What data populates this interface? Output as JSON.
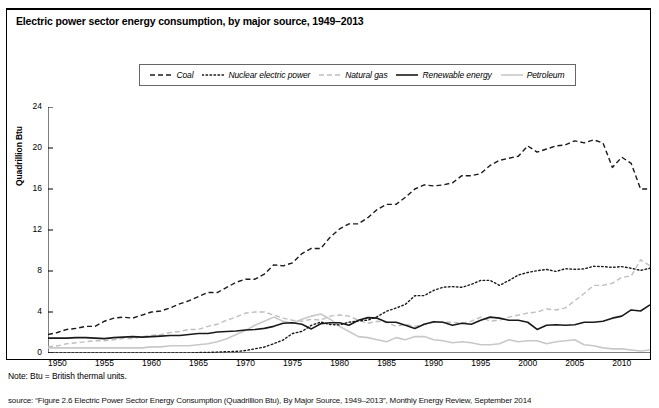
{
  "figure": {
    "title": "Electric power sector energy consumption, by major source, 1949–2013",
    "note": "Note: Btu = British thermal units.",
    "source": "source: “Figure 2.6  Electric Power Sector Energy Consumption (Quadrillion Btu), By Major Source, 1949–2013”, Monthly Energy Review, September 2014"
  },
  "chart_data": {
    "type": "line",
    "title": "Electric power sector energy consumption, by major source, 1949–2013",
    "xlabel": "",
    "ylabel": "Quadrillion Btu",
    "xlim": [
      1949,
      2013
    ],
    "ylim": [
      0,
      24
    ],
    "yticks": [
      0,
      4,
      8,
      12,
      16,
      20,
      24
    ],
    "xticks": [
      1950,
      1955,
      1960,
      1965,
      1970,
      1975,
      1980,
      1985,
      1990,
      1995,
      2000,
      2005,
      2010
    ],
    "grid": false,
    "legend_position": "top-center",
    "x": [
      1949,
      1950,
      1951,
      1952,
      1953,
      1954,
      1955,
      1956,
      1957,
      1958,
      1959,
      1960,
      1961,
      1962,
      1963,
      1964,
      1965,
      1966,
      1967,
      1968,
      1969,
      1970,
      1971,
      1972,
      1973,
      1974,
      1975,
      1976,
      1977,
      1978,
      1979,
      1980,
      1981,
      1982,
      1983,
      1984,
      1985,
      1986,
      1987,
      1988,
      1989,
      1990,
      1991,
      1992,
      1993,
      1994,
      1995,
      1996,
      1997,
      1998,
      1999,
      2000,
      2001,
      2002,
      2003,
      2004,
      2005,
      2006,
      2007,
      2008,
      2009,
      2010,
      2011,
      2012,
      2013
    ],
    "series": [
      {
        "name": "Coal",
        "style": "dashed",
        "color": "#1a1a1a",
        "values": [
          1.8,
          2.0,
          2.3,
          2.4,
          2.6,
          2.6,
          3.1,
          3.4,
          3.5,
          3.4,
          3.7,
          4.0,
          4.1,
          4.4,
          4.8,
          5.1,
          5.5,
          5.9,
          5.9,
          6.4,
          6.9,
          7.2,
          7.2,
          7.7,
          8.6,
          8.5,
          8.8,
          9.7,
          10.2,
          10.2,
          11.3,
          12.1,
          12.6,
          12.6,
          13.2,
          14.0,
          14.5,
          14.5,
          15.2,
          16.0,
          16.4,
          16.3,
          16.4,
          16.6,
          17.3,
          17.3,
          17.5,
          18.3,
          18.8,
          19.0,
          19.2,
          20.2,
          19.6,
          19.9,
          20.2,
          20.3,
          20.7,
          20.5,
          20.8,
          20.5,
          18.1,
          19.1,
          18.5,
          16.0,
          16.0
        ]
      },
      {
        "name": "Nuclear electric power",
        "style": "dotted",
        "color": "#1a1a1a",
        "values": [
          0.0,
          0.0,
          0.0,
          0.0,
          0.0,
          0.0,
          0.0,
          0.0,
          0.0,
          0.0,
          0.0,
          0.0,
          0.0,
          0.0,
          0.0,
          0.0,
          0.04,
          0.06,
          0.09,
          0.13,
          0.15,
          0.24,
          0.41,
          0.58,
          0.91,
          1.27,
          1.9,
          2.11,
          2.7,
          3.02,
          2.78,
          2.74,
          3.01,
          3.13,
          3.2,
          3.55,
          4.08,
          4.38,
          4.75,
          5.59,
          5.6,
          6.1,
          6.42,
          6.48,
          6.41,
          6.69,
          7.08,
          7.09,
          6.6,
          7.07,
          7.61,
          7.86,
          8.03,
          8.15,
          7.96,
          8.22,
          8.16,
          8.21,
          8.46,
          8.43,
          8.35,
          8.43,
          8.27,
          8.06,
          8.27
        ]
      },
      {
        "name": "Natural gas",
        "style": "dashed",
        "color": "#bfbfbf",
        "values": [
          0.6,
          0.7,
          0.9,
          1.0,
          1.1,
          1.2,
          1.2,
          1.3,
          1.4,
          1.4,
          1.6,
          1.7,
          1.8,
          2.0,
          2.1,
          2.3,
          2.3,
          2.6,
          2.8,
          3.2,
          3.5,
          3.9,
          4.0,
          4.0,
          3.7,
          3.4,
          3.2,
          3.1,
          3.3,
          3.2,
          3.6,
          3.7,
          3.6,
          3.2,
          2.9,
          3.1,
          3.0,
          2.6,
          2.8,
          2.6,
          2.8,
          3.0,
          3.0,
          3.0,
          2.9,
          3.1,
          3.5,
          3.1,
          3.2,
          3.5,
          3.7,
          3.9,
          4.0,
          4.3,
          4.2,
          4.4,
          5.1,
          5.8,
          6.6,
          6.6,
          6.8,
          7.4,
          7.5,
          9.1,
          8.5
        ]
      },
      {
        "name": "Renewable energy",
        "style": "solid",
        "color": "#1a1a1a",
        "values": [
          1.45,
          1.45,
          1.45,
          1.5,
          1.5,
          1.45,
          1.4,
          1.5,
          1.55,
          1.6,
          1.55,
          1.6,
          1.65,
          1.7,
          1.7,
          1.8,
          1.9,
          1.9,
          2.05,
          2.1,
          2.15,
          2.25,
          2.3,
          2.4,
          2.6,
          2.9,
          2.95,
          2.8,
          2.35,
          2.85,
          2.95,
          2.95,
          2.7,
          3.2,
          3.45,
          3.4,
          3.0,
          3.0,
          2.7,
          2.4,
          2.8,
          3.05,
          3.0,
          2.7,
          2.9,
          2.8,
          3.2,
          3.5,
          3.4,
          3.2,
          3.2,
          3.0,
          2.3,
          2.7,
          2.75,
          2.7,
          2.75,
          3.0,
          3.0,
          3.1,
          3.4,
          3.6,
          4.2,
          4.1,
          4.7
        ]
      },
      {
        "name": "Petroleum",
        "style": "solid",
        "color": "#c8c8c8",
        "values": [
          0.5,
          0.5,
          0.5,
          0.5,
          0.5,
          0.5,
          0.5,
          0.5,
          0.5,
          0.5,
          0.5,
          0.6,
          0.6,
          0.7,
          0.7,
          0.7,
          0.8,
          0.9,
          1.1,
          1.4,
          1.8,
          2.2,
          2.7,
          3.1,
          3.5,
          3.1,
          2.9,
          3.3,
          3.6,
          3.8,
          3.3,
          2.6,
          2.1,
          1.6,
          1.5,
          1.3,
          1.1,
          1.5,
          1.3,
          1.6,
          1.6,
          1.3,
          1.2,
          1.0,
          1.1,
          1.0,
          0.8,
          0.8,
          0.9,
          1.3,
          1.1,
          1.2,
          1.2,
          0.9,
          1.1,
          1.2,
          1.3,
          0.8,
          0.7,
          0.5,
          0.4,
          0.4,
          0.3,
          0.2,
          0.3
        ]
      }
    ]
  },
  "legend": {
    "items": [
      {
        "label": "Coal",
        "style": "dashed",
        "color": "#1a1a1a"
      },
      {
        "label": "Nuclear electric power",
        "style": "dotted",
        "color": "#1a1a1a"
      },
      {
        "label": "Natural gas",
        "style": "dashed",
        "color": "#bfbfbf"
      },
      {
        "label": "Renewable energy",
        "style": "solid",
        "color": "#1a1a1a"
      },
      {
        "label": "Petroleum",
        "style": "solid",
        "color": "#c8c8c8"
      }
    ]
  },
  "axes": {
    "y": {
      "label": "Quadrillion Btu",
      "ticks": [
        "0",
        "4",
        "8",
        "12",
        "16",
        "20",
        "24"
      ]
    },
    "x": {
      "ticks": [
        "1950",
        "1955",
        "1960",
        "1965",
        "1970",
        "1975",
        "1980",
        "1985",
        "1990",
        "1995",
        "2000",
        "2005",
        "2010"
      ]
    }
  }
}
